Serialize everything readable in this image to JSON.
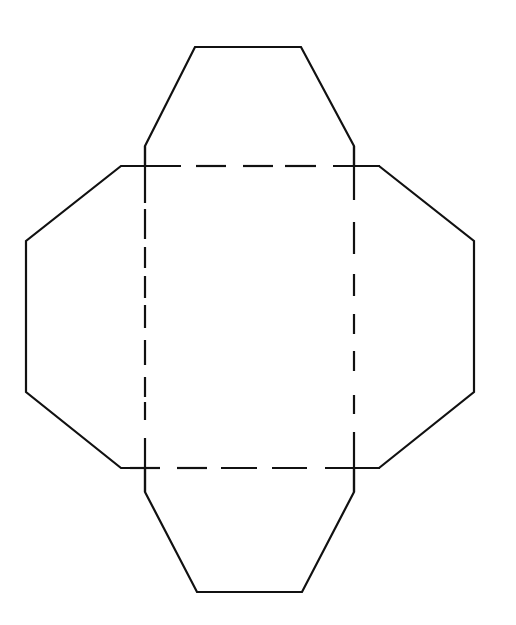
{
  "diagram": {
    "title": "",
    "colors": {
      "background": "#ffffff",
      "line": "#111111"
    },
    "center_square": {
      "x1": 145,
      "y1": 166,
      "x2": 354,
      "y2": 468
    },
    "flaps": {
      "top": [
        [
          145,
          166
        ],
        [
          145,
          146
        ],
        [
          195,
          47
        ],
        [
          301,
          47
        ],
        [
          354,
          146
        ],
        [
          354,
          166
        ]
      ],
      "left": [
        [
          145,
          166
        ],
        [
          121,
          166
        ],
        [
          26,
          241
        ],
        [
          26,
          392
        ],
        [
          121,
          468
        ],
        [
          145,
          468
        ]
      ],
      "right": [
        [
          354,
          166
        ],
        [
          379,
          166
        ],
        [
          474,
          241
        ],
        [
          474,
          392
        ],
        [
          379,
          468
        ],
        [
          354,
          468
        ]
      ],
      "bottom": [
        [
          145,
          468
        ],
        [
          145,
          492
        ],
        [
          197,
          592
        ],
        [
          302,
          592
        ],
        [
          354,
          492
        ],
        [
          354,
          468
        ]
      ]
    },
    "fold_lines": {
      "top_horizontal_dash_segments": [
        [
          130,
          181
        ],
        [
          196,
          226
        ],
        [
          243,
          273
        ],
        [
          285,
          316
        ],
        [
          333,
          380
        ]
      ],
      "bottom_horizontal_dash_segments": [
        [
          130,
          160
        ],
        [
          177,
          207
        ],
        [
          221,
          257
        ],
        [
          272,
          307
        ],
        [
          325,
          380
        ]
      ],
      "left_vertical_dash_segments": [
        [
          146,
          203
        ],
        [
          209,
          239
        ],
        [
          247,
          268
        ],
        [
          276,
          298
        ],
        [
          305,
          328
        ],
        [
          340,
          365
        ],
        [
          377,
          397
        ],
        [
          402,
          420
        ],
        [
          438,
          492
        ]
      ],
      "right_vertical_dash_segments": [
        [
          146,
          200
        ],
        [
          222,
          254
        ],
        [
          274,
          296
        ],
        [
          314,
          334
        ],
        [
          351,
          371
        ],
        [
          395,
          414
        ],
        [
          432,
          492
        ]
      ]
    },
    "labels": []
  }
}
